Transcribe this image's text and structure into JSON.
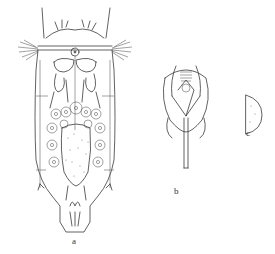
{
  "figure": {
    "panels": [
      {
        "id": "a",
        "label": "a",
        "description": "rotifer dorsal view"
      },
      {
        "id": "b",
        "label": "b",
        "description": "trophi"
      },
      {
        "id": "c",
        "label": "c",
        "description": "detail"
      }
    ]
  }
}
